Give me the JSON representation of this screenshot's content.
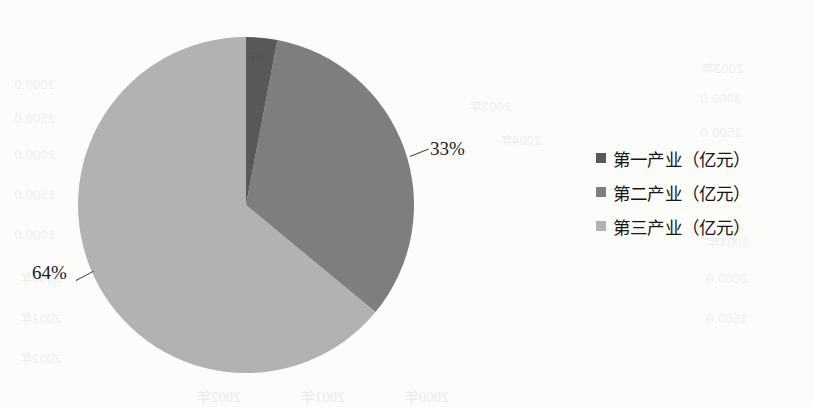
{
  "chart_data": {
    "type": "pie",
    "title": "",
    "xlabel": "",
    "ylabel": "",
    "categories": [
      "第一产业（亿元）",
      "第二产业（亿元）",
      "第三产业（亿元）"
    ],
    "values": [
      3,
      33,
      64
    ],
    "data_labels": [
      "3%",
      "33%",
      "64%"
    ],
    "colors": [
      "#595959",
      "#7f7f7f",
      "#b3b3b3"
    ],
    "legend_position": "right",
    "grid": false,
    "start_angle_deg": 0,
    "direction": "clockwise"
  },
  "labels": {
    "slice_1": "3%",
    "slice_2": "33%",
    "slice_3": "64%"
  },
  "legend": {
    "items": [
      {
        "label": "第一产业（亿元）",
        "color": "#595959"
      },
      {
        "label": "第二产业（亿元）",
        "color": "#7f7f7f"
      },
      {
        "label": "第三产业（亿元）",
        "color": "#b3b3b3"
      }
    ]
  },
  "bleed_through": [
    "2000年",
    "2001年",
    "2002年",
    "2003年",
    "2004年",
    "3000.0",
    "2500.0",
    "2000.0",
    "1500.0",
    "1000.0"
  ]
}
